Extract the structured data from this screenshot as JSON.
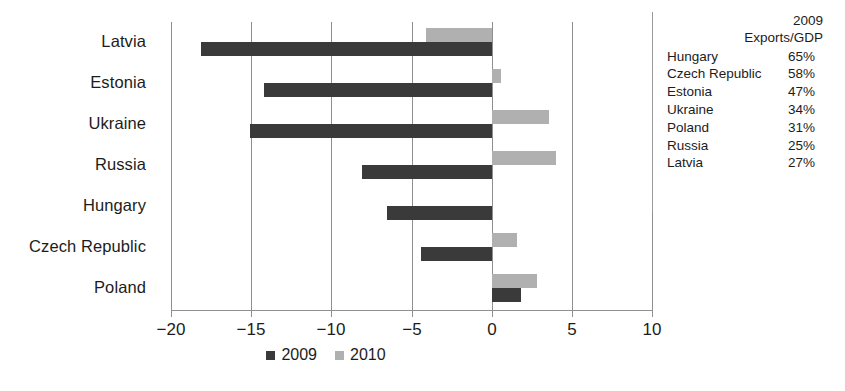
{
  "chart_data": {
    "type": "bar",
    "orientation": "horizontal",
    "title": "",
    "subtitle": "",
    "xlabel": "",
    "ylabel": "",
    "categories": [
      "Latvia",
      "Estonia",
      "Ukraine",
      "Russia",
      "Hungary",
      "Czech Republic",
      "Poland"
    ],
    "series": [
      {
        "name": "2009",
        "color": "#3a3a3a",
        "values": [
          -18.1,
          -14.2,
          -15.1,
          -8.1,
          -6.5,
          -4.4,
          1.8
        ]
      },
      {
        "name": "2010",
        "color": "#b0b0b0",
        "values": [
          -4.1,
          0.6,
          3.6,
          4.0,
          0.0,
          1.6,
          2.8
        ]
      }
    ],
    "xlim": [
      -20,
      10
    ],
    "xticks": [
      -20,
      -15,
      -10,
      -5,
      0,
      5,
      10
    ],
    "xtick_labels": [
      "−20",
      "−15",
      "−10",
      "−5",
      "0",
      "5",
      "10"
    ],
    "grid": true,
    "grid_axis": "x",
    "legend_position": "bottom-center",
    "legend_entries": [
      "2009",
      "2010"
    ]
  },
  "side_table": {
    "header_line1": "2009",
    "header_line2": "Exports/GDP",
    "rows": [
      {
        "country": "Hungary",
        "value": "65%"
      },
      {
        "country": "Czech Republic",
        "value": "58%"
      },
      {
        "country": "Estonia",
        "value": "47%"
      },
      {
        "country": "Ukraine",
        "value": "34%"
      },
      {
        "country": "Poland",
        "value": "31%"
      },
      {
        "country": "Russia",
        "value": "25%"
      },
      {
        "country": "Latvia",
        "value": "27%"
      }
    ]
  },
  "colors": {
    "series_2009": "#3a3a3a",
    "series_2010": "#b0b0b0",
    "axis": "#8f8f8f",
    "text": "#1c1c1c",
    "background": "#ffffff"
  }
}
